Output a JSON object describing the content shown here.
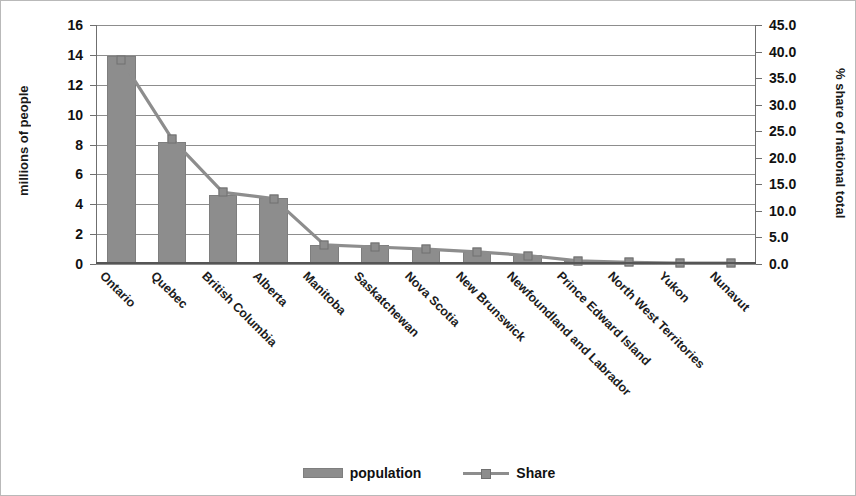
{
  "chart_data": {
    "type": "bar",
    "title": "",
    "subtitle": "",
    "xlabel": "",
    "ylabel": "millions of people",
    "y2label": "% share of national total",
    "categories": [
      "Ontario",
      "Quebec",
      "British Columbia",
      "Alberta",
      "Manitoba",
      "Saskatchewan",
      "Nova Scotia",
      "New Brunswick",
      "Newfoundland and Labrador",
      "Prince Edward Island",
      "North West Territories",
      "Yukon",
      "Nunavut"
    ],
    "series": [
      {
        "name": "population",
        "type": "bar",
        "axis": "left",
        "unit": "millions of people",
        "values": [
          13.9,
          8.2,
          4.6,
          4.4,
          1.25,
          1.3,
          1.0,
          0.8,
          0.6,
          0.2,
          0.1,
          0.05,
          0.05
        ]
      },
      {
        "name": "Share",
        "type": "line",
        "axis": "right",
        "unit": "% share of national total",
        "values": [
          38.5,
          23.5,
          13.5,
          12.3,
          3.6,
          3.2,
          2.8,
          2.3,
          1.6,
          0.6,
          0.3,
          0.15,
          0.15
        ]
      }
    ],
    "ylim": [
      0,
      16
    ],
    "yticks": [
      0,
      2,
      4,
      6,
      8,
      10,
      12,
      14,
      16
    ],
    "ytick_labels": [
      "0",
      "2",
      "4",
      "6",
      "8",
      "10",
      "12",
      "14",
      "16"
    ],
    "y2lim": [
      0,
      45
    ],
    "y2ticks": [
      0,
      5,
      10,
      15,
      20,
      25,
      30,
      35,
      40,
      45
    ],
    "y2tick_labels": [
      "0.0",
      "5.0",
      "10.0",
      "15.0",
      "20.0",
      "25.0",
      "30.0",
      "35.0",
      "40.0",
      "45.0"
    ],
    "grid": true,
    "grid_axis": "y",
    "legend_position": "bottom",
    "legend": [
      "population",
      "Share"
    ],
    "colors": {
      "bar": "#8d8d8d",
      "line": "#8d8d8d",
      "marker": "#8d8d8d",
      "grid": "#8d8d8d",
      "axis": "#6f6f6f",
      "text": "#111111",
      "background": "#ffffff",
      "frame": "#b9b9b9"
    }
  }
}
